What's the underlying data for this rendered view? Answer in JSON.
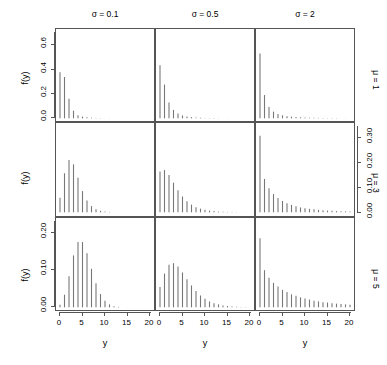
{
  "chart_data": {
    "type": "bar",
    "title": "",
    "xlabel": "y",
    "ylabel": "f(y)",
    "xlim": [
      0,
      20
    ],
    "grid": false,
    "legend": "none",
    "layout": "3x3 lattice of discrete probability mass spike plots",
    "col_headers": [
      {
        "label": "σ = 0.1",
        "sigma": 0.1
      },
      {
        "label": "σ = 0.5",
        "sigma": 0.5
      },
      {
        "label": "σ = 2",
        "sigma": 2
      }
    ],
    "row_headers": [
      {
        "label": "μ = 1",
        "mu": 1
      },
      {
        "label": "μ = 3",
        "mu": 3
      },
      {
        "label": "μ = 5",
        "mu": 5
      }
    ],
    "x": [
      0,
      1,
      2,
      3,
      4,
      5,
      6,
      7,
      8,
      9,
      10,
      11,
      12,
      13,
      14,
      15,
      16,
      17,
      18,
      19,
      20
    ],
    "rows": [
      {
        "mu": 1,
        "ylim": [
          0,
          0.7
        ],
        "yticks": [
          0.0,
          0.2,
          0.4,
          0.6
        ],
        "ytick_labels": [
          "0.0",
          "0.2",
          "0.4",
          "0.6"
        ],
        "axis_side": "left",
        "panels": [
          {
            "sigma": 0.1,
            "values": [
              0.378,
              0.339,
              0.161,
              0.063,
              0.026,
              0.014,
              0.008,
              0.005,
              0.003,
              0.002,
              0.0015,
              0.001,
              0.0008,
              0.0006,
              0.0004,
              0.0003,
              0.0002,
              0.0002,
              0.0001,
              0.0001,
              0.0001
            ]
          },
          {
            "sigma": 0.5,
            "values": [
              0.435,
              0.277,
              0.129,
              0.069,
              0.04,
              0.024,
              0.015,
              0.01,
              0.007,
              0.005,
              0.0035,
              0.0025,
              0.0018,
              0.0013,
              0.001,
              0.0007,
              0.0005,
              0.0004,
              0.0003,
              0.0002,
              0.0002
            ]
          },
          {
            "sigma": 2,
            "values": [
              0.531,
              0.191,
              0.093,
              0.055,
              0.036,
              0.025,
              0.018,
              0.014,
              0.011,
              0.008,
              0.007,
              0.005,
              0.004,
              0.004,
              0.003,
              0.002,
              0.002,
              0.002,
              0.001,
              0.001,
              0.001
            ]
          }
        ]
      },
      {
        "mu": 3,
        "ylim": [
          0,
          0.345
        ],
        "yticks": [
          0.0,
          0.1,
          0.2,
          0.3
        ],
        "ytick_labels": [
          "0.00",
          "0.10",
          "0.20",
          "0.30"
        ],
        "axis_side": "right",
        "panels": [
          {
            "sigma": 0.1,
            "values": [
              0.059,
              0.158,
              0.212,
              0.194,
              0.14,
              0.086,
              0.048,
              0.025,
              0.012,
              0.006,
              0.003,
              0.0014,
              0.0007,
              0.0003,
              0.0002,
              0.0001,
              0.0001,
              5e-05,
              3e-05,
              2e-05,
              1e-05
            ]
          },
          {
            "sigma": 0.5,
            "values": [
              0.165,
              0.171,
              0.151,
              0.12,
              0.089,
              0.064,
              0.045,
              0.031,
              0.021,
              0.015,
              0.01,
              0.007,
              0.005,
              0.003,
              0.002,
              0.0016,
              0.0011,
              0.0008,
              0.0005,
              0.0004,
              0.0003
            ]
          },
          {
            "sigma": 2,
            "values": [
              0.31,
              0.135,
              0.097,
              0.074,
              0.058,
              0.046,
              0.037,
              0.03,
              0.025,
              0.02,
              0.017,
              0.014,
              0.012,
              0.01,
              0.008,
              0.007,
              0.006,
              0.005,
              0.004,
              0.004,
              0.003
            ]
          }
        ]
      },
      {
        "mu": 5,
        "ylim": [
          0,
          0.23
        ],
        "yticks": [
          0.0,
          0.1,
          0.2
        ],
        "ytick_labels": [
          "0.00",
          "0.10",
          "0.20"
        ],
        "axis_side": "left",
        "panels": [
          {
            "sigma": 0.1,
            "values": [
              0.007,
              0.034,
              0.084,
              0.14,
              0.176,
              0.176,
              0.146,
              0.104,
              0.065,
              0.036,
              0.018,
              0.008,
              0.003,
              0.0013,
              0.0005,
              0.0002,
              0.0001,
              3e-05,
              1e-05,
              5e-06,
              2e-06
            ]
          },
          {
            "sigma": 0.5,
            "values": [
              0.055,
              0.091,
              0.115,
              0.119,
              0.11,
              0.094,
              0.076,
              0.059,
              0.044,
              0.032,
              0.023,
              0.016,
              0.011,
              0.008,
              0.005,
              0.0035,
              0.0024,
              0.0016,
              0.0011,
              0.0007,
              0.0005
            ]
          },
          {
            "sigma": 2,
            "values": [
              0.186,
              0.1,
              0.08,
              0.066,
              0.056,
              0.047,
              0.041,
              0.035,
              0.031,
              0.027,
              0.024,
              0.021,
              0.018,
              0.016,
              0.014,
              0.013,
              0.011,
              0.01,
              0.009,
              0.008,
              0.007
            ]
          }
        ]
      }
    ],
    "xticks": [
      0,
      5,
      10,
      15,
      20
    ],
    "xtick_labels": [
      "0",
      "5",
      "10",
      "15",
      "20"
    ]
  },
  "style": {
    "bar_color": "#777777",
    "axis_color": "#555555",
    "text_color": "#000000"
  }
}
